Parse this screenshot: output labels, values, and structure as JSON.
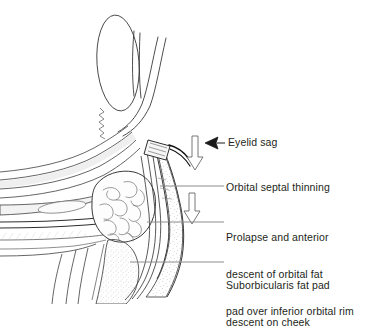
{
  "figure": {
    "background_color": "#ffffff",
    "line_color": "#231f20",
    "text_color": "#231f20",
    "leader_color": "#808080"
  },
  "annotations": [
    {
      "id": "eyelid-sag",
      "text": "Eyelid sag",
      "marker": "solid-left-arrowhead",
      "leader": "short-horizontal"
    },
    {
      "id": "orbital-septal-thinning",
      "text": "Orbital septal thinning",
      "marker": "none",
      "leader": "long-horizontal"
    },
    {
      "id": "prolapse-orbital-fat",
      "text": "Prolapse and anterior\ndescent of orbital fat\npad over inferior orbital rim",
      "line1": "Prolapse and anterior",
      "line2": "descent of orbital fat",
      "line3": "pad over inferior orbital rim",
      "marker": "none",
      "leader": "long-horizontal"
    },
    {
      "id": "suborbicularis-fat-pad",
      "text": "Suborbicularis fat pad\ndescent on cheek",
      "line1": "Suborbicularis fat pad",
      "line2": "descent on cheek",
      "marker": "none",
      "leader": "long-horizontal"
    }
  ],
  "arrows": [
    {
      "id": "descent-arrow-upper",
      "direction": "down",
      "style": "hollow-outline"
    },
    {
      "id": "descent-arrow-lower",
      "direction": "down",
      "style": "hollow-outline"
    },
    {
      "id": "eyelid-sag-arrowhead",
      "direction": "left",
      "style": "solid-filled"
    }
  ],
  "anatomy": [
    {
      "id": "globe",
      "name": "eyeball-globe"
    },
    {
      "id": "upper-lid",
      "name": "upper-eyelid"
    },
    {
      "id": "levator",
      "name": "levator-aponeurosis"
    },
    {
      "id": "tarsal-plate",
      "name": "tarsal-plate"
    },
    {
      "id": "eyelashes",
      "name": "eyelashes"
    },
    {
      "id": "orbital-fat-pad",
      "name": "orbital-fat-pad"
    },
    {
      "id": "orbital-septum",
      "name": "orbital-septum"
    },
    {
      "id": "orbicularis",
      "name": "orbicularis-oculi-muscle"
    },
    {
      "id": "suborbicularis-fat",
      "name": "suborbicularis-oculi-fat"
    },
    {
      "id": "orbital-rim",
      "name": "inferior-orbital-rim-bone"
    },
    {
      "id": "cheek",
      "name": "cheek-soft-tissue"
    },
    {
      "id": "inferior-rectus",
      "name": "inferior-rectus-muscle"
    }
  ]
}
